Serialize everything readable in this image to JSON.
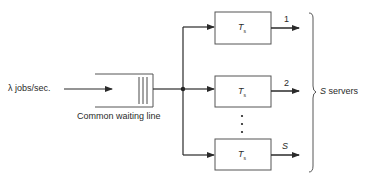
{
  "diagram": {
    "type": "multi-server queue",
    "input": {
      "label": "λ jobs/sec."
    },
    "queue": {
      "label": "Common waiting line"
    },
    "servers": [
      {
        "label_main": "T",
        "label_sub": "s",
        "output_label": "1"
      },
      {
        "label_main": "T",
        "label_sub": "s",
        "output_label": "2"
      },
      {
        "label_main": "T",
        "label_sub": "s",
        "output_label": "S"
      }
    ],
    "ellipsis": "⋮",
    "group": {
      "count_symbol": "S",
      "label": "servers"
    },
    "colors": {
      "line": "#2a2a2a",
      "box_border": "#555555",
      "background": "#ffffff"
    }
  }
}
